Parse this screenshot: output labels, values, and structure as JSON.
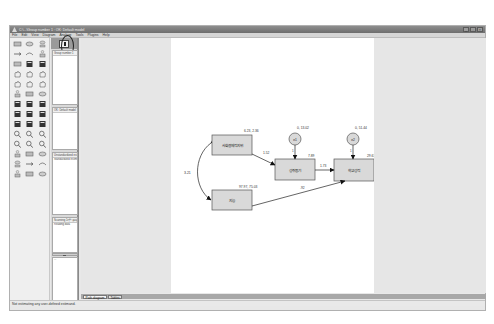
{
  "window": {
    "title": "C:\\...\\Group number 1 : OK: Default model",
    "controls": [
      "_",
      "□",
      "×"
    ]
  },
  "menubar": {
    "items": [
      "File",
      "Edit",
      "View",
      "Diagram",
      "Analyze",
      "Tools",
      "Plugins",
      "Help"
    ]
  },
  "toolbox": {
    "tools": [
      "draw-observed-variable",
      "draw-unobserved-variable",
      "draw-latent-variable-indicator",
      "draw-path",
      "draw-covariance",
      "add-unique-variable",
      "list-variables-in-model",
      "list-variables-in-dataset",
      "select-one-object",
      "select-all-objects",
      "deselect-all-objects",
      "duplicate-objects",
      "move-objects",
      "erase-objects",
      "change-shape",
      "rotate-indicators",
      "reflect-indicators",
      "move-parameter-values",
      "scroll",
      "touch-up",
      "select-data-files",
      "analysis-properties",
      "calculate-estimates",
      "view-text",
      "copy-to-clipboard",
      "save-diagram",
      "object-properties",
      "drag-properties",
      "preserve-symmetries",
      "zoom-in",
      "zoom-selected",
      "zoom-out",
      "zoom-page",
      "fit-to-page",
      "loupe",
      "bayesian-estimation",
      "bootstrap",
      "multiple-group",
      "specification-search",
      "undo",
      "redo",
      "specification-search-binoculars"
    ]
  },
  "panel": {
    "view_output_button": "view-output-path-diagram",
    "groups_label": "Group number 1",
    "models_label": "OK: Default model",
    "estimates_label_1": "Unstandardized estimates",
    "estimates_label_2": "Standardized estimates",
    "computation_label_1": "Scanning 1기말 경로분석 최",
    "computation_label_2": "Reading data",
    "files_label": "..."
  },
  "tabs": [
    {
      "label": "Path diagram",
      "active": true
    },
    {
      "label": "Tables",
      "active": false
    }
  ],
  "status": {
    "text": "Not estimating any user-defined estimand."
  },
  "diagram": {
    "nodes": [
      {
        "id": "ses",
        "type": "observed",
        "label": "사회경제적지위",
        "stats": "6.23, 2.36"
      },
      {
        "id": "iq",
        "type": "observed",
        "label": "지능",
        "stats": "97.97, 75.03"
      },
      {
        "id": "motivation",
        "type": "observed",
        "label": "성취동기",
        "stats": "7.89"
      },
      {
        "id": "achievement",
        "type": "observed",
        "label": "학교성적",
        "stats": "29.63"
      },
      {
        "id": "e1",
        "type": "error",
        "label": "e1",
        "stats": "0, 13.02"
      },
      {
        "id": "e2",
        "type": "error",
        "label": "e2",
        "stats": "0, 51.44"
      }
    ],
    "paths": [
      {
        "from": "ses",
        "to": "motivation",
        "label": "1.52"
      },
      {
        "from": "motivation",
        "to": "achievement",
        "label": "1.73"
      },
      {
        "from": "iq",
        "to": "achievement",
        "label": ".92"
      },
      {
        "from": "e1",
        "to": "motivation",
        "label": "1"
      },
      {
        "from": "e2",
        "to": "achievement",
        "label": "1"
      }
    ],
    "covariances": [
      {
        "between": [
          "ses",
          "iq"
        ],
        "label": "3.21"
      }
    ]
  }
}
